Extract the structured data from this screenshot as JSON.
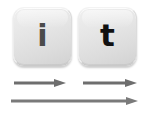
{
  "figure": {
    "width": 146,
    "height": 114,
    "background_color": "#ffffff"
  },
  "keys": [
    {
      "id": "i",
      "label": "i",
      "name": "keycap-i",
      "label_color": "#4b4b4b",
      "cap_color": "#e2e2e2"
    },
    {
      "id": "t",
      "label": "t",
      "name": "keycap-t",
      "label_color": "#111111",
      "cap_color": "#e2e2e2"
    }
  ],
  "arrows": [
    {
      "id": "short-left",
      "icon": "arrow-right-icon",
      "color": "#6e6e6e",
      "length": 52,
      "direction": "right"
    },
    {
      "id": "short-right",
      "icon": "arrow-right-icon",
      "color": "#6e6e6e",
      "length": 54,
      "direction": "right"
    },
    {
      "id": "long",
      "icon": "arrow-right-icon",
      "color": "#7a7a7a",
      "length": 127,
      "direction": "right"
    }
  ]
}
